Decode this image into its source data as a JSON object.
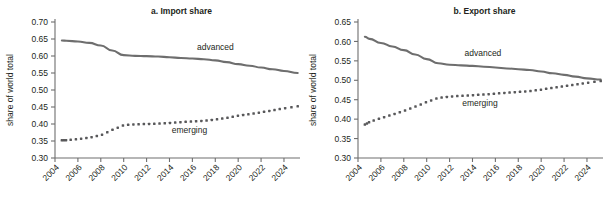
{
  "figure": {
    "width": 606,
    "height": 205,
    "background": "#ffffff",
    "line_color": "#6e6e6e",
    "dot_color": "#58585a",
    "text_color": "#231f20"
  },
  "chart_data": [
    {
      "type": "line",
      "panel_id": "a",
      "title": "a. Import share",
      "xlabel": "",
      "ylabel": "share of world total",
      "xlim": [
        2004,
        2025.4
      ],
      "ylim": [
        0.3,
        0.7
      ],
      "yticks": [
        0.3,
        0.35,
        0.4,
        0.45,
        0.5,
        0.55,
        0.6,
        0.65,
        0.7
      ],
      "ytick_labels": [
        "0.30",
        "0.35",
        "0.40",
        "0.45",
        "0.50",
        "0.55",
        "0.60",
        "0.65",
        "0.70"
      ],
      "xticks": [
        2004,
        2006,
        2008,
        2010,
        2012,
        2014,
        2016,
        2018,
        2020,
        2022,
        2024
      ],
      "xtick_labels": [
        "2004",
        "2006",
        "2008",
        "2010",
        "2012",
        "2014",
        "2016",
        "2018",
        "2020",
        "2022",
        "2024"
      ],
      "xtick_rotation": -45,
      "grid": false,
      "legend_position": "inline-annotation",
      "x": [
        2004.6,
        2005,
        2006,
        2007,
        2008,
        2009,
        2010,
        2011,
        2012,
        2013,
        2014,
        2015,
        2016,
        2017,
        2018,
        2019,
        2020,
        2021,
        2022,
        2023,
        2024,
        2025.2
      ],
      "series": [
        {
          "name": "advanced",
          "style": "solid",
          "label_x": 2016.4,
          "label_y": 0.6185,
          "values": [
            0.6455,
            0.645,
            0.6425,
            0.6385,
            0.631,
            0.616,
            0.6025,
            0.6005,
            0.5995,
            0.5985,
            0.5965,
            0.594,
            0.5925,
            0.5905,
            0.587,
            0.582,
            0.576,
            0.5715,
            0.566,
            0.561,
            0.556,
            0.55
          ]
        },
        {
          "name": "emerging",
          "style": "dotted",
          "label_x": 2014.2,
          "label_y": 0.3745,
          "values": [
            0.352,
            0.3525,
            0.3555,
            0.36,
            0.367,
            0.3825,
            0.3965,
            0.399,
            0.4,
            0.401,
            0.403,
            0.4055,
            0.4075,
            0.4095,
            0.413,
            0.418,
            0.4245,
            0.429,
            0.4345,
            0.44,
            0.446,
            0.452
          ]
        }
      ]
    },
    {
      "type": "line",
      "panel_id": "b",
      "title": "b. Export share",
      "xlabel": "",
      "ylabel": "share of world total",
      "xlim": [
        2004,
        2025.4
      ],
      "ylim": [
        0.3,
        0.65
      ],
      "yticks": [
        0.3,
        0.35,
        0.4,
        0.45,
        0.5,
        0.55,
        0.6,
        0.65
      ],
      "ytick_labels": [
        "0.30",
        "0.35",
        "0.40",
        "0.45",
        "0.50",
        "0.55",
        "0.60",
        "0.65"
      ],
      "xticks": [
        2004,
        2006,
        2008,
        2010,
        2012,
        2014,
        2016,
        2018,
        2020,
        2022,
        2024
      ],
      "xtick_labels": [
        "2004",
        "2006",
        "2008",
        "2010",
        "2012",
        "2014",
        "2016",
        "2018",
        "2020",
        "2022",
        "2024"
      ],
      "xtick_rotation": -45,
      "grid": false,
      "legend_position": "inline-annotation",
      "x": [
        2004.6,
        2005,
        2006,
        2007,
        2008,
        2009,
        2010,
        2011,
        2012,
        2013,
        2014,
        2015,
        2016,
        2017,
        2018,
        2019,
        2020,
        2021,
        2022,
        2023,
        2024,
        2025.2
      ],
      "series": [
        {
          "name": "advanced",
          "style": "solid",
          "label_x": 2013.3,
          "label_y": 0.562,
          "values": [
            0.612,
            0.6065,
            0.596,
            0.587,
            0.5775,
            0.5665,
            0.5545,
            0.544,
            0.54,
            0.5385,
            0.537,
            0.535,
            0.533,
            0.5305,
            0.5285,
            0.5265,
            0.5225,
            0.518,
            0.514,
            0.5095,
            0.505,
            0.502
          ]
        },
        {
          "name": "emerging",
          "style": "dotted",
          "label_x": 2013.1,
          "label_y": 0.4345,
          "values": [
            0.386,
            0.3925,
            0.4025,
            0.4115,
            0.421,
            0.432,
            0.444,
            0.4545,
            0.458,
            0.46,
            0.4615,
            0.4635,
            0.4655,
            0.468,
            0.47,
            0.472,
            0.476,
            0.4805,
            0.4845,
            0.489,
            0.4935,
            0.498
          ]
        }
      ]
    }
  ]
}
